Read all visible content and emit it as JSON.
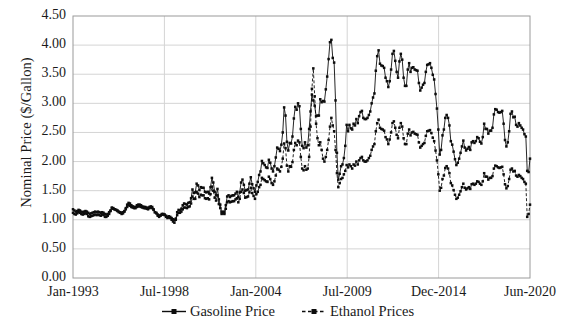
{
  "axis": {
    "ylabel": "Nominal Price ($/Gallon)",
    "yticks": [
      "4.50",
      "4.00",
      "3.50",
      "3.00",
      "2.50",
      "2.00",
      "1.50",
      "1.00",
      "0.50",
      "0.00"
    ],
    "xticks": [
      "Jan-1993",
      "Jul-1998",
      "Jan-2004",
      "Jul-2009",
      "Dec-2014",
      "Jun-2020"
    ]
  },
  "legend": {
    "gasoline": "Gasoline Price",
    "ethanol": "Ethanol Prices"
  },
  "chart_data": {
    "type": "line",
    "title": "",
    "xlabel": "",
    "ylabel": "Nominal Price ($/Gallon)",
    "ylim": [
      0.0,
      4.5
    ],
    "ytick_step": 0.5,
    "xlim": [
      "Jan-1993",
      "Jun-2020"
    ],
    "xtick_labels": [
      "Jan-1993",
      "Jul-1998",
      "Jan-2004",
      "Jul-2009",
      "Dec-2014",
      "Jun-2020"
    ],
    "grid": "horizontal-and-vertical",
    "legend_position": "bottom-center",
    "line_color": "#0d0d0d",
    "marker": "filled-square",
    "x_unit": "month",
    "x_start": "Jan-1993",
    "n_points": 330,
    "series": [
      {
        "name": "Gasoline Price",
        "line_style": "solid",
        "values": [
          1.12,
          1.1,
          1.09,
          1.11,
          1.13,
          1.12,
          1.1,
          1.09,
          1.1,
          1.11,
          1.1,
          1.06,
          1.05,
          1.06,
          1.07,
          1.08,
          1.09,
          1.08,
          1.09,
          1.08,
          1.07,
          1.09,
          1.08,
          1.05,
          1.05,
          1.07,
          1.1,
          1.15,
          1.21,
          1.2,
          1.18,
          1.17,
          1.15,
          1.13,
          1.12,
          1.1,
          1.11,
          1.14,
          1.2,
          1.26,
          1.29,
          1.28,
          1.25,
          1.23,
          1.22,
          1.22,
          1.25,
          1.26,
          1.26,
          1.25,
          1.23,
          1.22,
          1.22,
          1.21,
          1.2,
          1.22,
          1.23,
          1.22,
          1.18,
          1.13,
          1.11,
          1.07,
          1.05,
          1.07,
          1.09,
          1.09,
          1.08,
          1.05,
          1.03,
          1.04,
          1.03,
          1.0,
          0.97,
          0.95,
          1.0,
          1.13,
          1.17,
          1.16,
          1.19,
          1.25,
          1.28,
          1.27,
          1.26,
          1.29,
          1.3,
          1.37,
          1.52,
          1.46,
          1.47,
          1.62,
          1.59,
          1.51,
          1.56,
          1.55,
          1.55,
          1.48,
          1.47,
          1.48,
          1.45,
          1.56,
          1.72,
          1.64,
          1.48,
          1.42,
          1.53,
          1.35,
          1.26,
          1.13,
          1.14,
          1.13,
          1.25,
          1.4,
          1.42,
          1.39,
          1.41,
          1.42,
          1.42,
          1.45,
          1.48,
          1.39,
          1.47,
          1.64,
          1.69,
          1.6,
          1.5,
          1.51,
          1.52,
          1.62,
          1.73,
          1.61,
          1.54,
          1.48,
          1.59,
          1.65,
          1.77,
          1.83,
          2.01,
          1.97,
          1.94,
          1.9,
          1.89,
          2.03,
          1.98,
          1.88,
          1.83,
          1.92,
          2.07,
          2.24,
          2.22,
          2.18,
          2.29,
          2.5,
          2.93,
          2.79,
          2.34,
          2.19,
          2.32,
          2.31,
          2.43,
          2.74,
          2.94,
          2.89,
          3.0,
          2.95,
          2.56,
          2.27,
          2.23,
          2.33,
          2.24,
          2.28,
          2.56,
          2.86,
          3.15,
          3.05,
          2.96,
          2.78,
          2.79,
          2.79,
          3.07,
          3.02,
          3.04,
          3.03,
          3.24,
          3.46,
          3.76,
          4.05,
          4.09,
          3.78,
          3.7,
          3.05,
          2.15,
          1.69,
          1.79,
          1.92,
          1.95,
          2.06,
          2.27,
          2.63,
          2.52,
          2.63,
          2.57,
          2.55,
          2.65,
          2.62,
          2.73,
          2.66,
          2.78,
          2.85,
          2.87,
          2.75,
          2.73,
          2.73,
          2.75,
          2.8,
          2.86,
          3.0,
          3.1,
          3.17,
          3.56,
          3.81,
          3.91,
          3.68,
          3.65,
          3.64,
          3.61,
          3.44,
          3.38,
          3.28,
          3.38,
          3.58,
          3.85,
          3.9,
          3.73,
          3.54,
          3.44,
          3.72,
          3.85,
          3.75,
          3.44,
          3.3,
          3.3,
          3.58,
          3.69,
          3.54,
          3.61,
          3.62,
          3.58,
          3.57,
          3.56,
          3.35,
          3.22,
          3.27,
          3.32,
          3.35,
          3.54,
          3.66,
          3.67,
          3.69,
          3.61,
          3.49,
          3.41,
          3.16,
          2.91,
          2.55,
          2.12,
          2.2,
          2.45,
          2.55,
          2.75,
          2.8,
          2.75,
          2.62,
          2.35,
          2.29,
          2.17,
          2.04,
          1.94,
          1.98,
          2.05,
          2.15,
          2.26,
          2.36,
          2.24,
          2.19,
          2.22,
          2.25,
          2.2,
          2.33,
          2.35,
          2.32,
          2.35,
          2.42,
          2.4,
          2.34,
          2.31,
          2.42,
          2.65,
          2.56,
          2.56,
          2.48,
          2.53,
          2.53,
          2.58,
          2.81,
          2.9,
          2.89,
          2.85,
          2.84,
          2.85,
          2.87,
          2.65,
          2.37,
          2.26,
          2.33,
          2.52,
          2.82,
          2.86,
          2.76,
          2.77,
          2.63,
          2.6,
          2.66,
          2.62,
          2.58,
          2.55,
          2.47,
          2.43,
          1.84,
          1.82,
          2.05
        ]
      },
      {
        "name": "Ethanol Prices",
        "line_style": "dashed",
        "values": [
          1.18,
          1.16,
          1.14,
          1.15,
          1.17,
          1.16,
          1.14,
          1.13,
          1.14,
          1.15,
          1.14,
          1.12,
          1.1,
          1.11,
          1.12,
          1.13,
          1.14,
          1.13,
          1.14,
          1.13,
          1.12,
          1.13,
          1.12,
          1.1,
          1.09,
          1.1,
          1.13,
          1.16,
          1.2,
          1.19,
          1.18,
          1.17,
          1.16,
          1.14,
          1.13,
          1.12,
          1.13,
          1.15,
          1.18,
          1.22,
          1.25,
          1.24,
          1.22,
          1.21,
          1.2,
          1.2,
          1.22,
          1.23,
          1.23,
          1.22,
          1.21,
          1.2,
          1.2,
          1.19,
          1.18,
          1.2,
          1.21,
          1.2,
          1.17,
          1.13,
          1.12,
          1.09,
          1.07,
          1.08,
          1.1,
          1.1,
          1.09,
          1.07,
          1.05,
          1.06,
          1.05,
          1.03,
          1.01,
          1.0,
          1.02,
          1.08,
          1.12,
          1.12,
          1.14,
          1.18,
          1.21,
          1.21,
          1.2,
          1.22,
          1.23,
          1.28,
          1.4,
          1.36,
          1.36,
          1.48,
          1.45,
          1.39,
          1.43,
          1.42,
          1.42,
          1.37,
          1.36,
          1.37,
          1.35,
          1.44,
          1.57,
          1.5,
          1.38,
          1.33,
          1.42,
          1.27,
          1.2,
          1.1,
          1.11,
          1.1,
          1.19,
          1.3,
          1.32,
          1.3,
          1.31,
          1.32,
          1.32,
          1.35,
          1.37,
          1.3,
          1.36,
          1.48,
          1.52,
          1.46,
          1.38,
          1.39,
          1.4,
          1.47,
          1.55,
          1.46,
          1.41,
          1.36,
          1.44,
          1.48,
          1.56,
          1.6,
          1.72,
          1.7,
          1.68,
          1.66,
          1.65,
          1.74,
          1.7,
          1.63,
          1.6,
          1.66,
          1.76,
          1.88,
          1.86,
          1.83,
          1.91,
          2.05,
          2.31,
          2.23,
          1.93,
          1.83,
          1.92,
          1.91,
          1.99,
          2.2,
          2.32,
          2.28,
          2.36,
          2.33,
          2.08,
          1.88,
          1.85,
          1.92,
          1.86,
          1.88,
          2.08,
          2.6,
          3.25,
          3.6,
          3.12,
          2.65,
          2.4,
          2.28,
          2.33,
          2.2,
          2.05,
          2.0,
          2.08,
          2.2,
          2.37,
          2.6,
          2.75,
          2.62,
          2.52,
          2.2,
          1.8,
          1.56,
          1.63,
          1.7,
          1.72,
          1.78,
          1.84,
          1.94,
          1.9,
          1.95,
          1.92,
          1.88,
          1.95,
          1.93,
          2.0,
          1.95,
          2.02,
          2.06,
          2.08,
          2.02,
          2.0,
          2.0,
          2.02,
          2.06,
          2.1,
          2.2,
          2.26,
          2.3,
          2.52,
          2.66,
          2.72,
          2.58,
          2.56,
          2.55,
          2.53,
          2.42,
          2.38,
          2.3,
          2.38,
          2.5,
          2.66,
          2.69,
          2.58,
          2.46,
          2.4,
          2.58,
          2.66,
          2.6,
          2.4,
          2.3,
          2.3,
          2.48,
          2.55,
          2.45,
          2.5,
          2.51,
          2.48,
          2.47,
          2.46,
          2.33,
          2.24,
          2.27,
          2.3,
          2.32,
          2.44,
          2.52,
          2.53,
          2.54,
          2.49,
          2.41,
          2.35,
          2.19,
          2.02,
          1.78,
          1.5,
          1.55,
          1.7,
          1.76,
          1.89,
          1.92,
          1.88,
          1.8,
          1.63,
          1.59,
          1.51,
          1.43,
          1.36,
          1.38,
          1.43,
          1.49,
          1.56,
          1.62,
          1.55,
          1.52,
          1.54,
          1.56,
          1.53,
          1.61,
          1.62,
          1.6,
          1.62,
          1.66,
          1.65,
          1.62,
          1.6,
          1.66,
          1.8,
          1.74,
          1.74,
          1.69,
          1.72,
          1.72,
          1.75,
          1.88,
          1.93,
          1.92,
          1.9,
          1.89,
          1.9,
          1.91,
          1.78,
          1.61,
          1.54,
          1.58,
          1.7,
          1.86,
          1.88,
          1.83,
          1.84,
          1.76,
          1.74,
          1.77,
          1.75,
          1.72,
          1.7,
          1.65,
          1.62,
          1.05,
          1.1,
          1.26
        ]
      }
    ]
  }
}
